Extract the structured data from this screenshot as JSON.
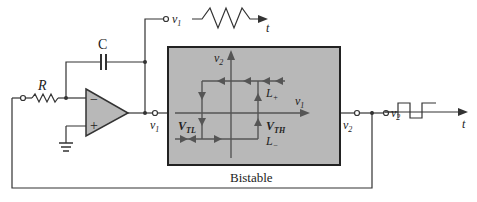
{
  "components": {
    "resistor": "R",
    "capacitor": "C",
    "opamp_minus": "−",
    "opamp_plus": "+",
    "block": "Bistable"
  },
  "nodes": {
    "v1_top": "v",
    "v1_top_sub": "1",
    "v1_mid": "v",
    "v1_mid_sub": "1",
    "v2_out": "v",
    "v2_out_sub": "2",
    "v2_term": "v",
    "v2_term_sub": "2"
  },
  "graph": {
    "y_axis": "v",
    "y_axis_sub": "2",
    "x_axis": "v",
    "x_axis_sub": "1",
    "vtl": "V",
    "vtl_sub": "TL",
    "vth": "V",
    "vth_sub": "TH",
    "lplus": "L",
    "lplus_sub": "+",
    "lminus": "L",
    "lminus_sub": "−"
  },
  "waveforms": {
    "triangle_t": "t",
    "square_t": "t"
  },
  "colors": {
    "line": "#333333",
    "block_fill": "#b8b8b8",
    "graph_line": "#555555"
  }
}
